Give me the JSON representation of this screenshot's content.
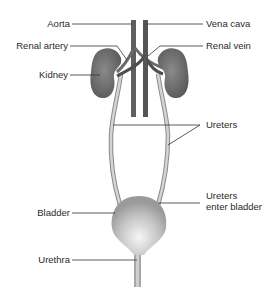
{
  "diagram": {
    "labels": {
      "aorta": "Aorta",
      "vena_cava": "Vena cava",
      "renal_artery": "Renal artery",
      "renal_vein": "Renal vein",
      "kidney": "Kidney",
      "ureters": "Ureters",
      "ureters_enter_1": "Ureters",
      "ureters_enter_2": "enter bladder",
      "bladder": "Bladder",
      "urethra": "Urethra"
    },
    "colors": {
      "kidney": "#7a7a7a",
      "vessel": "#5e5e5e",
      "ureter": "#b9b9b9",
      "bladder": "#c8c8c8",
      "leader": "#333333"
    }
  }
}
